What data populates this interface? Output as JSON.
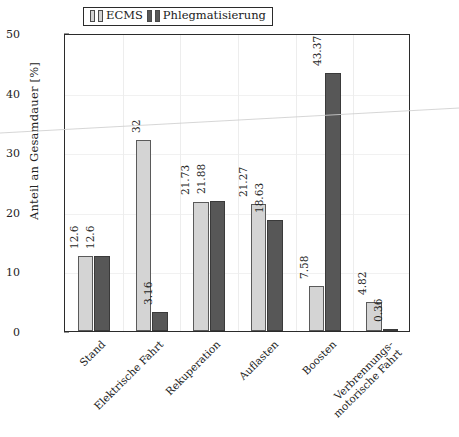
{
  "chart_data": {
    "type": "bar",
    "title": "",
    "xlabel": "",
    "ylabel": "Anteil an Gesamdauer [%]",
    "ylim": [
      0,
      50
    ],
    "yticks": [
      0,
      10,
      20,
      30,
      40,
      50
    ],
    "grid": true,
    "legend_position": "top-center",
    "categories": [
      "Stand",
      "Elektrische Fahrt",
      "Rekuperation",
      "Auflasten",
      "Boosten",
      "Verbrennungs-|motorische Fahrt"
    ],
    "category_lines": [
      [
        "Stand"
      ],
      [
        "Elektrische Fahrt"
      ],
      [
        "Rekuperation"
      ],
      [
        "Auflasten"
      ],
      [
        "Boosten"
      ],
      [
        "Verbrennungs-",
        "motorische Fahrt"
      ]
    ],
    "series": [
      {
        "name": "ECMS",
        "color": "#d4d4d4",
        "values": [
          12.6,
          32,
          21.73,
          21.27,
          7.58,
          4.82
        ],
        "value_labels": [
          "12.6",
          "32",
          "21.73",
          "21.27",
          "7.58",
          "4.82"
        ]
      },
      {
        "name": "Phlegmatisierung",
        "color": "#575757",
        "values": [
          12.6,
          3.16,
          21.88,
          18.63,
          43.37,
          0.36
        ],
        "value_labels": [
          "12.6",
          "3.16",
          "21.88",
          "18.63",
          "43.37",
          "0.36"
        ]
      }
    ]
  },
  "legend": {
    "entries": [
      {
        "label": "ECMS",
        "swatch": "light-gray-swatch-icon"
      },
      {
        "label": "Phlegmatisierung",
        "swatch": "dark-gray-swatch-icon"
      }
    ]
  },
  "axis": {
    "y_title": "Anteil an Gesamdauer [%]",
    "y_tick_labels": [
      "50",
      "40",
      "30",
      "20",
      "10",
      "0"
    ]
  }
}
